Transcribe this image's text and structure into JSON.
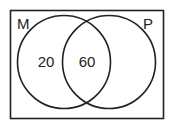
{
  "diagram": {
    "type": "venn",
    "sets": [
      {
        "label": "M",
        "only_value": "20"
      },
      {
        "label": "P",
        "only_value": ""
      }
    ],
    "intersection_value": "60",
    "colors": {
      "stroke": "#222222",
      "background": "#ffffff"
    }
  }
}
